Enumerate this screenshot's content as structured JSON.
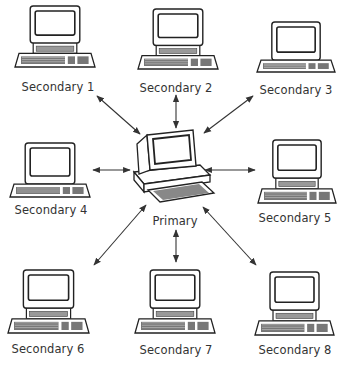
{
  "diagram": {
    "type": "star-network",
    "center": {
      "id": "primary",
      "label": "Primary"
    },
    "nodes": [
      {
        "id": "s1",
        "label": "Secondary 1"
      },
      {
        "id": "s2",
        "label": "Secondary 2"
      },
      {
        "id": "s3",
        "label": "Secondary 3"
      },
      {
        "id": "s4",
        "label": "Secondary 4"
      },
      {
        "id": "s5",
        "label": "Secondary 5"
      },
      {
        "id": "s6",
        "label": "Secondary 6"
      },
      {
        "id": "s7",
        "label": "Secondary 7"
      },
      {
        "id": "s8",
        "label": "Secondary 8"
      }
    ],
    "edges": [
      {
        "from": "primary",
        "to": "s1",
        "direction": "bidirectional"
      },
      {
        "from": "primary",
        "to": "s2",
        "direction": "bidirectional"
      },
      {
        "from": "primary",
        "to": "s3",
        "direction": "bidirectional"
      },
      {
        "from": "primary",
        "to": "s4",
        "direction": "bidirectional"
      },
      {
        "from": "primary",
        "to": "s5",
        "direction": "bidirectional"
      },
      {
        "from": "primary",
        "to": "s6",
        "direction": "bidirectional"
      },
      {
        "from": "primary",
        "to": "s7",
        "direction": "bidirectional"
      },
      {
        "from": "primary",
        "to": "s8",
        "direction": "bidirectional"
      }
    ],
    "node_icon": "desktop-computer-icon"
  }
}
